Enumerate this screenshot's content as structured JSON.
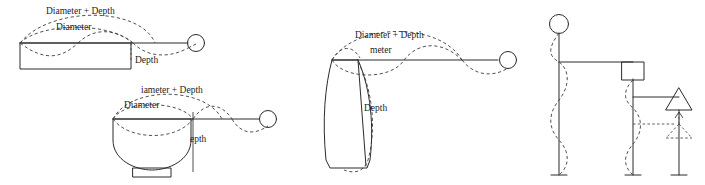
{
  "canvas": {
    "width": 705,
    "height": 185,
    "background": "#ffffff",
    "ink": "#2b2b2b",
    "dash_ink": "#3d3d3d"
  },
  "figures": [
    {
      "id": "figure-1",
      "name": "shallow-rectangular-vessel-profile",
      "shape": "shallow rectangular vessel (flat open dish) in section",
      "labels": {
        "diameter_plus_depth": "Diameter + Depth",
        "diameter": "Diameter",
        "depth": "Depth"
      },
      "has_terminal_circle": true
    },
    {
      "id": "figure-2",
      "name": "hemispherical-bowl-profile",
      "shape": "hemispherical bowl with small ring foot in section",
      "labels": {
        "diameter_plus_depth": "iameter + Depth",
        "diameter": "Diameter",
        "depth": "epth"
      },
      "has_terminal_circle": true
    },
    {
      "id": "figure-3",
      "name": "tall-jar-profile",
      "shape": "tall tapering jar in section",
      "labels": {
        "diameter_plus_depth": "Diameter + Depth",
        "diameter": "meter",
        "depth": "Depth"
      },
      "has_terminal_circle": true
    },
    {
      "id": "figure-4",
      "name": "stem-schematic",
      "shape": "three vertical stems carrying circle, square and triangle markers with dashed sinusoidal overlays",
      "markers": [
        "circle",
        "square",
        "triangle"
      ],
      "labels": {}
    }
  ]
}
